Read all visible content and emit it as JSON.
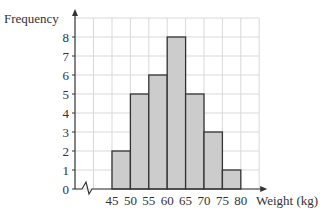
{
  "chart_data": {
    "type": "bar",
    "subtype": "histogram",
    "title": "",
    "xlabel": "Weight (kg)",
    "ylabel": "Frequency",
    "bins": [
      [
        45,
        50
      ],
      [
        50,
        55
      ],
      [
        55,
        60
      ],
      [
        60,
        65
      ],
      [
        65,
        70
      ],
      [
        70,
        75
      ],
      [
        75,
        80
      ]
    ],
    "categories": [
      "45-50",
      "50-55",
      "55-60",
      "60-65",
      "65-70",
      "70-75",
      "75-80"
    ],
    "values": [
      2,
      5,
      6,
      8,
      5,
      3,
      1
    ],
    "x_ticks": [
      45,
      50,
      55,
      60,
      65,
      70,
      75,
      80
    ],
    "y_ticks": [
      0,
      1,
      2,
      3,
      4,
      5,
      6,
      7,
      8
    ],
    "ylim": [
      0,
      9
    ],
    "xlim": [
      40,
      85
    ],
    "axis_break": "x-axis zigzag between 0 and 45",
    "grid": true,
    "bar_color": "#cccccc",
    "bar_edge_color": "#333333",
    "grid_color": "#d9d9d9"
  },
  "labels": {
    "ylabel": "Frequency",
    "xlabel": "Weight (kg)"
  }
}
